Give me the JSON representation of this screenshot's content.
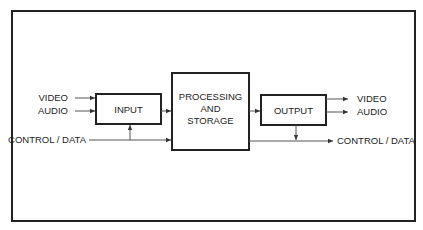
{
  "diagram": {
    "blocks": {
      "input": {
        "label": "INPUT"
      },
      "processing": {
        "lines": [
          "PROCESSING",
          "AND",
          "STORAGE"
        ]
      },
      "output": {
        "label": "OUTPUT"
      }
    },
    "inputs": {
      "video": "VIDEO",
      "audio": "AUDIO",
      "control": "CONTROL / DATA"
    },
    "outputs": {
      "video": "VIDEO",
      "audio": "AUDIO",
      "control": "CONTROL / DATA"
    },
    "colors": {
      "stroke": "#222222",
      "background": "#ffffff"
    }
  }
}
